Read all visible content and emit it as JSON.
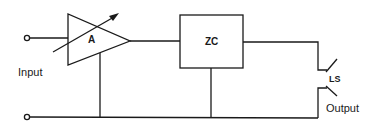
{
  "diagram": {
    "type": "circuit-schematic",
    "components": {
      "amplifier": {
        "label": "A",
        "variable": true
      },
      "zero_crossing": {
        "label": "ZC"
      },
      "switch": {
        "label": "LS"
      }
    },
    "terminals": {
      "input_label": "Input",
      "output_label": "Output"
    },
    "colors": {
      "line": "#1a1a1a",
      "background": "#ffffff"
    }
  }
}
